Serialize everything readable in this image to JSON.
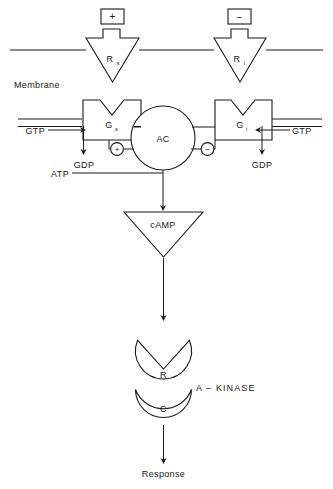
{
  "diagram": {
    "stroke_color": "#1a1a1a",
    "background_color": "#ffffff",
    "membrane_label": "Membrane",
    "stimulatory_sign": "+",
    "inhibitory_sign": "−",
    "receptors": [
      {
        "id": "rs",
        "label": "R",
        "subscript": "s",
        "name": "stimulatory-receptor"
      },
      {
        "id": "ri",
        "label": "R",
        "subscript": "i",
        "name": "inhibitory-receptor"
      }
    ],
    "g_proteins": [
      {
        "id": "gs",
        "label": "G",
        "subscript": "s",
        "name": "gs-protein"
      },
      {
        "id": "gi",
        "label": "G",
        "subscript": "i",
        "name": "gi-protein"
      }
    ],
    "enzyme": {
      "label": "AC",
      "name": "adenylate-cyclase"
    },
    "modulators": [
      {
        "id": "plus",
        "sign": "+",
        "name": "activation-node"
      },
      {
        "id": "minus",
        "sign": "−",
        "name": "inhibition-node"
      }
    ],
    "nucleotides": {
      "gtp_left": "GTP",
      "gtp_right": "GTP",
      "gdp_left": "GDP",
      "gdp_right": "GDP",
      "atp": "ATP"
    },
    "second_messenger": {
      "label": "cAMP",
      "name": "camp-node"
    },
    "kinase": {
      "group_label": "A – KINASE",
      "regulatory_subunit": "R",
      "catalytic_subunit": "C"
    },
    "output": {
      "label": "Response"
    }
  }
}
